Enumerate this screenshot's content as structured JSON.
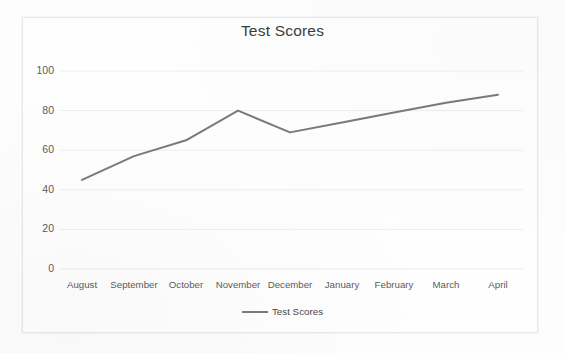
{
  "chart_data": {
    "type": "line",
    "title": "Test Scores",
    "xlabel": "",
    "ylabel": "",
    "categories": [
      "August",
      "September",
      "October",
      "November",
      "December",
      "January",
      "February",
      "March",
      "April"
    ],
    "series": [
      {
        "name": "Test Scores",
        "values": [
          45,
          57,
          65,
          80,
          69,
          74,
          79,
          84,
          88
        ],
        "color": "#7a7a7a"
      }
    ],
    "ylim": [
      0,
      100
    ],
    "yticks": [
      0,
      20,
      40,
      60,
      80,
      100
    ],
    "grid": "horizontal",
    "legend_position": "bottom",
    "markers": "none"
  },
  "legend": {
    "entries": [
      {
        "label": "Test Scores",
        "swatch": "line-swatch"
      }
    ]
  }
}
